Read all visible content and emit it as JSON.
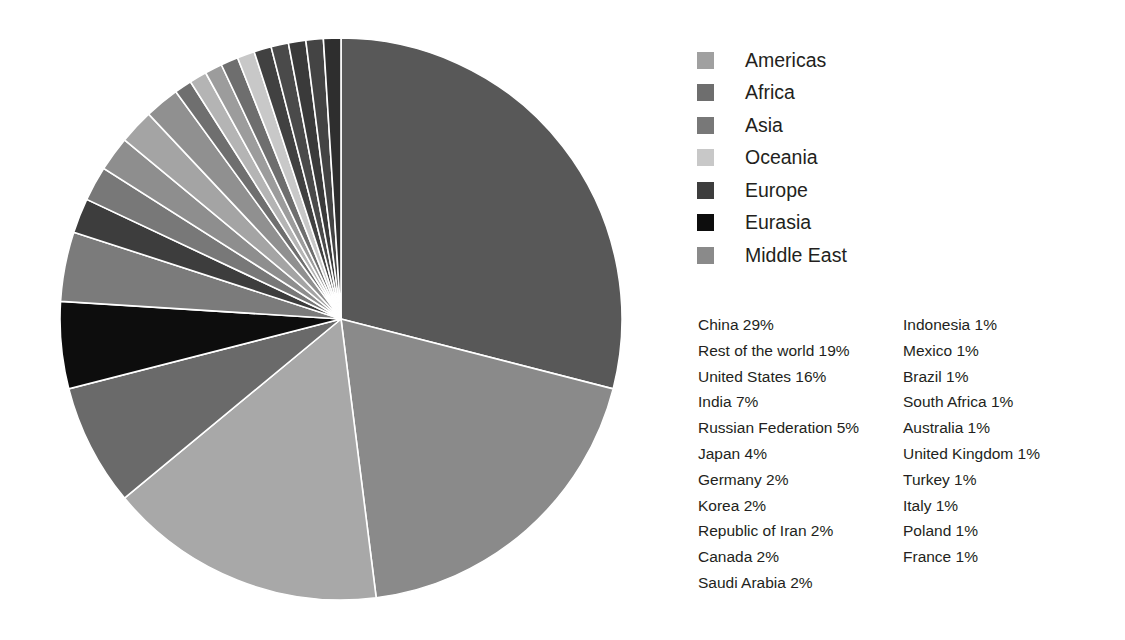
{
  "chart_data": {
    "type": "pie",
    "title": "",
    "subtitle": "",
    "xlabel": "",
    "ylabel": "",
    "grid": false,
    "legend_position": "right",
    "start_angle_deg": 0,
    "direction": "clockwise",
    "units": "percent",
    "total_percent": 100,
    "center": {
      "x": 283,
      "y": 283
    },
    "radius": 281,
    "legend": {
      "entries": [
        {
          "label": "Americas",
          "color": "#a0a0a0"
        },
        {
          "label": "Africa",
          "color": "#6e6e6e"
        },
        {
          "label": "Asia",
          "color": "#787878"
        },
        {
          "label": "Oceania",
          "color": "#c8c8c8"
        },
        {
          "label": "Europe",
          "color": "#3d3d3d"
        },
        {
          "label": "Eurasia",
          "color": "#0d0d0d"
        },
        {
          "label": "Middle East",
          "color": "#8a8a8a"
        }
      ]
    },
    "categories": [
      "China",
      "Rest of the world",
      "United States",
      "India",
      "Russian Federation",
      "Japan",
      "Germany",
      "Korea",
      "Republic of Iran",
      "Canada",
      "Saudi Arabia",
      "Indonesia",
      "Mexico",
      "Brazil",
      "South Africa",
      "Australia",
      "United Kingdom",
      "Turkey",
      "Italy",
      "Poland",
      "France"
    ],
    "values": [
      29,
      19,
      16,
      7,
      5,
      4,
      2,
      2,
      2,
      2,
      2,
      1,
      1,
      1,
      1,
      1,
      1,
      1,
      1,
      1,
      1
    ],
    "slices": [
      {
        "name": "China",
        "value": 29,
        "region": "Asia",
        "color": "#585858"
      },
      {
        "name": "Rest of the world",
        "value": 19,
        "region": "Middle East",
        "color": "#8a8a8a"
      },
      {
        "name": "United States",
        "value": 16,
        "region": "Americas",
        "color": "#a8a8a8"
      },
      {
        "name": "India",
        "value": 7,
        "region": "Asia",
        "color": "#6a6a6a"
      },
      {
        "name": "Russian Federation",
        "value": 5,
        "region": "Eurasia",
        "color": "#0d0d0d"
      },
      {
        "name": "Japan",
        "value": 4,
        "region": "Asia",
        "color": "#7b7b7b"
      },
      {
        "name": "Germany",
        "value": 2,
        "region": "Europe",
        "color": "#3d3d3d"
      },
      {
        "name": "Korea",
        "value": 2,
        "region": "Asia",
        "color": "#787878"
      },
      {
        "name": "Republic of Iran",
        "value": 2,
        "region": "Middle East",
        "color": "#8e8e8e"
      },
      {
        "name": "Canada",
        "value": 2,
        "region": "Americas",
        "color": "#a4a4a4"
      },
      {
        "name": "Saudi Arabia",
        "value": 2,
        "region": "Middle East",
        "color": "#909090"
      },
      {
        "name": "Indonesia",
        "value": 1,
        "region": "Asia",
        "color": "#6f6f6f"
      },
      {
        "name": "Mexico",
        "value": 1,
        "region": "Americas",
        "color": "#b4b4b4"
      },
      {
        "name": "Brazil",
        "value": 1,
        "region": "Americas",
        "color": "#9c9c9c"
      },
      {
        "name": "South Africa",
        "value": 1,
        "region": "Africa",
        "color": "#6e6e6e"
      },
      {
        "name": "Australia",
        "value": 1,
        "region": "Oceania",
        "color": "#c8c8c8"
      },
      {
        "name": "United Kingdom",
        "value": 1,
        "region": "Europe",
        "color": "#414141"
      },
      {
        "name": "Turkey",
        "value": 1,
        "region": "Europe",
        "color": "#4a4a4a"
      },
      {
        "name": "Italy",
        "value": 1,
        "region": "Europe",
        "color": "#3a3a3a"
      },
      {
        "name": "Poland",
        "value": 1,
        "region": "Europe",
        "color": "#444444"
      },
      {
        "name": "France",
        "value": 1,
        "region": "Europe",
        "color": "#2e2e2e"
      }
    ],
    "data_labels": {
      "left_column": [
        "China 29%",
        "Rest of the world 19%",
        "United States 16%",
        "India 7%",
        "Russian Federation 5%",
        "Japan 4%",
        "Germany 2%",
        "Korea 2%",
        "Republic of Iran 2%",
        "Canada 2%",
        "Saudi Arabia 2%"
      ],
      "right_column": [
        "Indonesia 1%",
        "Mexico 1%",
        "Brazil 1%",
        "South Africa 1%",
        "Australia 1%",
        "United Kingdom 1%",
        "Turkey 1%",
        "Italy 1%",
        "Poland 1%",
        "France 1%"
      ]
    }
  },
  "colors": {
    "background": "#ffffff",
    "text": "#231f20",
    "slice_separator": "#ffffff"
  }
}
